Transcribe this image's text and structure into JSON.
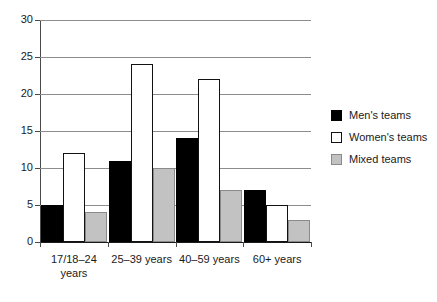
{
  "chart_data": {
    "type": "bar",
    "title": "",
    "subtitle": "",
    "xlabel": "",
    "ylabel": "",
    "ylim": [
      0,
      30
    ],
    "yticks": [
      0,
      5,
      10,
      15,
      20,
      25,
      30
    ],
    "ytick_labels": [
      "0",
      "5",
      "10",
      "15",
      "20",
      "25",
      "30"
    ],
    "grid": true,
    "grid_axis": "y",
    "legend_position": "right",
    "categories": [
      "17/18–24\nyears",
      "25–39 years",
      "40–59 years",
      "60+ years"
    ],
    "series": [
      {
        "name": "Men's teams",
        "color": "#000000",
        "edge_color": "#000000",
        "values": [
          5,
          11,
          14,
          7
        ]
      },
      {
        "name": "Women's teams",
        "color": "#ffffff",
        "edge_color": "#121212",
        "values": [
          12,
          24,
          22,
          5
        ]
      },
      {
        "name": "Mixed teams",
        "color": "#c2c2c2",
        "edge_color": "#8a8a8a",
        "values": [
          4,
          10,
          7,
          3
        ]
      }
    ]
  },
  "legend": {
    "items": [
      {
        "label": "Men's teams",
        "swatch": "men"
      },
      {
        "label": "Women's teams",
        "swatch": "women"
      },
      {
        "label": "Mixed teams",
        "swatch": "mixed"
      }
    ]
  }
}
